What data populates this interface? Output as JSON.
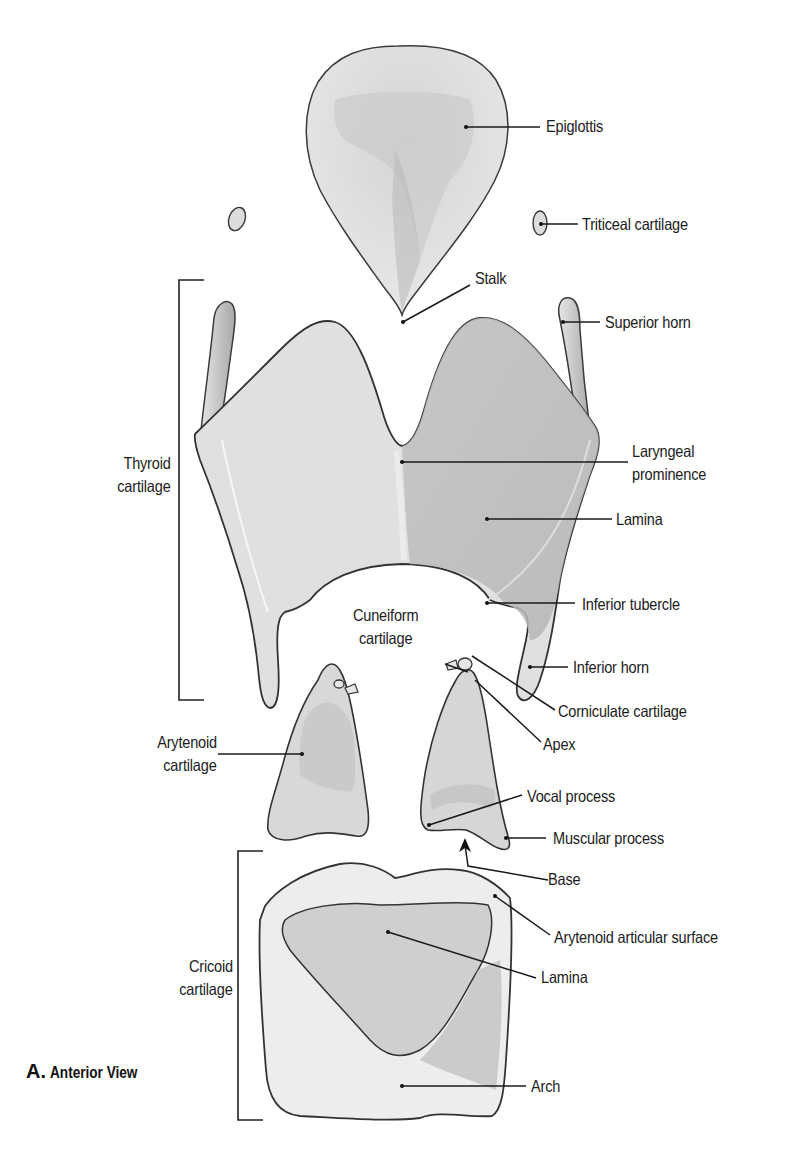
{
  "figure": {
    "caption_letter": "A.",
    "caption_text": "Anterior View"
  },
  "labels": {
    "epiglottis": "Epiglottis",
    "triticeal": "Triticeal cartilage",
    "stalk": "Stalk",
    "superior_horn": "Superior horn",
    "thyroid_line1": "Thyroid",
    "thyroid_line2": "cartilage",
    "laryngeal_line1": "Laryngeal",
    "laryngeal_line2": "prominence",
    "thyroid_lamina": "Lamina",
    "inferior_tubercle": "Inferior tubercle",
    "cuneiform_line1": "Cuneiform",
    "cuneiform_line2": "cartilage",
    "inferior_horn": "Inferior horn",
    "corniculate": "Corniculate cartilage",
    "apex": "Apex",
    "arytenoid_line1": "Arytenoid",
    "arytenoid_line2": "cartilage",
    "vocal_process": "Vocal process",
    "muscular_process": "Muscular process",
    "base": "Base",
    "arytenoid_articular": "Arytenoid articular surface",
    "cricoid_line1": "Cricoid",
    "cricoid_line2": "cartilage",
    "cricoid_lamina": "Lamina",
    "arch": "Arch"
  },
  "colors": {
    "outline": "#3a3a3a",
    "cartilage_light": "#e8e8e8",
    "cartilage_mid": "#c9c9c9",
    "cartilage_dark": "#a9a9a9",
    "leader_line": "#1a1a1a"
  }
}
